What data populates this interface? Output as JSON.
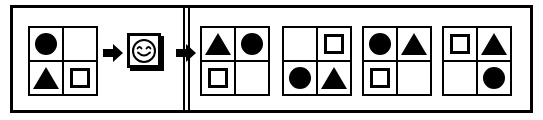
{
  "puzzle": {
    "type": "visual-analogy-matrix",
    "colors": {
      "ink": "#000000",
      "paper": "#ffffff"
    },
    "frame": {
      "label": "puzzle-frame"
    },
    "divider": {
      "label": "section-divider",
      "style": "double-vertical-line"
    },
    "problem": {
      "label": "problem-matrix",
      "cells": [
        {
          "position": "top-left",
          "shape": "filled-circle"
        },
        {
          "position": "top-right",
          "shape": "empty"
        },
        {
          "position": "bottom-left",
          "shape": "filled-triangle"
        },
        {
          "position": "bottom-right",
          "shape": "outlined-square"
        }
      ]
    },
    "operator": {
      "label": "transform-token",
      "icon": "smiley-face-icon",
      "arrow_before": "right-arrow-icon",
      "arrow_after": "right-arrow-icon"
    },
    "options": [
      {
        "id": "A",
        "label": "option-a",
        "cells": [
          {
            "position": "top-left",
            "shape": "filled-triangle"
          },
          {
            "position": "top-right",
            "shape": "filled-circle"
          },
          {
            "position": "bottom-left",
            "shape": "outlined-square"
          },
          {
            "position": "bottom-right",
            "shape": "empty"
          }
        ]
      },
      {
        "id": "B",
        "label": "option-b",
        "cells": [
          {
            "position": "top-left",
            "shape": "empty"
          },
          {
            "position": "top-right",
            "shape": "outlined-square"
          },
          {
            "position": "bottom-left",
            "shape": "filled-circle"
          },
          {
            "position": "bottom-right",
            "shape": "filled-triangle"
          }
        ]
      },
      {
        "id": "C",
        "label": "option-c",
        "cells": [
          {
            "position": "top-left",
            "shape": "filled-circle"
          },
          {
            "position": "top-right",
            "shape": "filled-triangle"
          },
          {
            "position": "bottom-left",
            "shape": "outlined-square"
          },
          {
            "position": "bottom-right",
            "shape": "empty"
          }
        ]
      },
      {
        "id": "D",
        "label": "option-d",
        "cells": [
          {
            "position": "top-left",
            "shape": "outlined-square"
          },
          {
            "position": "top-right",
            "shape": "filled-triangle"
          },
          {
            "position": "bottom-left",
            "shape": "empty"
          },
          {
            "position": "bottom-right",
            "shape": "filled-circle"
          }
        ]
      }
    ]
  }
}
